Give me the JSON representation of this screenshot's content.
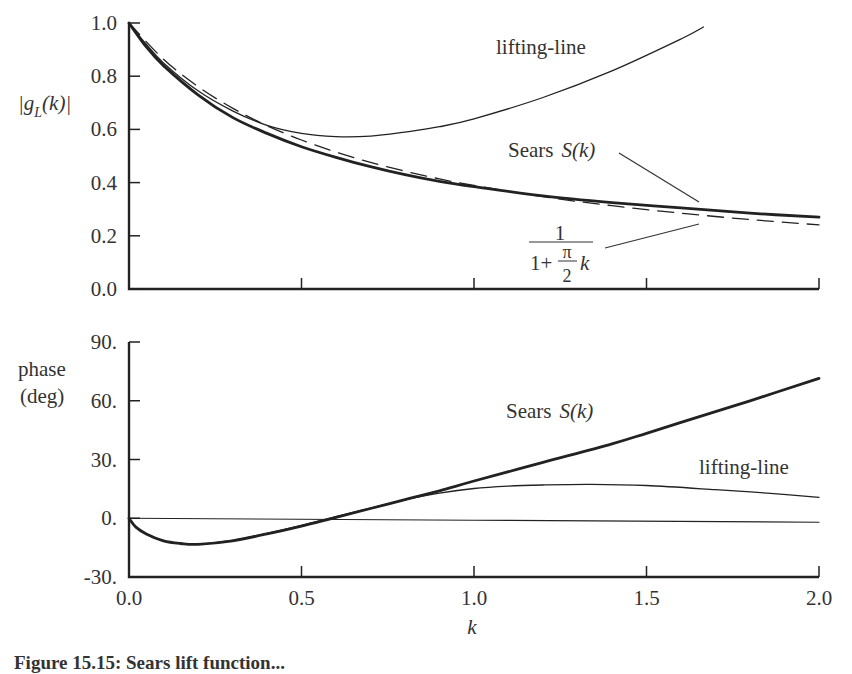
{
  "chart_data": [
    {
      "type": "line",
      "panel": "top",
      "title": "",
      "xlabel": "k",
      "ylabel": "|g_L(k)|",
      "xlim": [
        0.0,
        2.0
      ],
      "ylim": [
        0.0,
        1.0
      ],
      "x_ticks": [
        "0.0",
        "0.5",
        "1.0",
        "1.5",
        "2.0"
      ],
      "y_ticks": [
        "0.0",
        "0.2",
        "0.4",
        "0.6",
        "0.8",
        "1.0"
      ],
      "grid": false,
      "series": [
        {
          "name": "Sears S(k)",
          "style": "thick-solid",
          "x": [
            0,
            0.05,
            0.1,
            0.2,
            0.3,
            0.4,
            0.5,
            0.6,
            0.7,
            0.8,
            0.9,
            1.0,
            1.2,
            1.4,
            1.6,
            1.8,
            2.0
          ],
          "values": [
            1.0,
            0.91,
            0.84,
            0.73,
            0.645,
            0.585,
            0.535,
            0.495,
            0.46,
            0.43,
            0.405,
            0.385,
            0.35,
            0.325,
            0.305,
            0.285,
            0.27
          ]
        },
        {
          "name": "1/(1+(π/2)k)",
          "style": "dashed",
          "x": [
            0,
            0.1,
            0.2,
            0.3,
            0.4,
            0.5,
            0.6,
            0.7,
            0.8,
            0.9,
            1.0,
            1.2,
            1.4,
            1.6,
            1.8,
            2.0
          ],
          "values": [
            1.0,
            0.864,
            0.761,
            0.68,
            0.614,
            0.56,
            0.515,
            0.476,
            0.443,
            0.414,
            0.389,
            0.347,
            0.313,
            0.285,
            0.261,
            0.241
          ]
        },
        {
          "name": "lifting-line",
          "style": "thin-solid",
          "x": [
            0,
            0.05,
            0.1,
            0.2,
            0.3,
            0.4,
            0.5,
            0.6,
            0.7,
            0.8,
            0.9,
            1.0,
            1.2,
            1.4,
            1.6,
            1.665
          ],
          "values": [
            1.0,
            0.92,
            0.85,
            0.745,
            0.67,
            0.615,
            0.585,
            0.573,
            0.575,
            0.59,
            0.61,
            0.64,
            0.72,
            0.82,
            0.94,
            0.985
          ]
        }
      ],
      "annotations": [
        {
          "text": "lifting-line",
          "x": 1.1,
          "y": 0.86
        },
        {
          "text": "Sears",
          "italic_part": "S(k)",
          "x": 1.12,
          "y": 0.48
        },
        {
          "text": "1 / (1+ π/2 k)",
          "numerator": "1",
          "denominator_prefix": "1+",
          "pi": "π",
          "two": "2",
          "k": "k",
          "x": 1.1,
          "y": 0.2
        }
      ]
    },
    {
      "type": "line",
      "panel": "bottom",
      "title": "",
      "xlabel": "k",
      "ylabel": "phase (deg)",
      "xlim": [
        0.0,
        2.0
      ],
      "ylim": [
        -30,
        90
      ],
      "x_ticks": [
        "0.0",
        "0.5",
        "1.0",
        "1.5",
        "2.0"
      ],
      "y_ticks": [
        "-30.",
        "0.",
        "30.",
        "60.",
        "90."
      ],
      "grid": false,
      "series": [
        {
          "name": "Sears S(k)",
          "style": "thick-solid",
          "x": [
            0,
            0.02,
            0.05,
            0.1,
            0.15,
            0.2,
            0.3,
            0.4,
            0.5,
            0.6,
            0.7,
            0.8,
            0.9,
            1.0,
            1.2,
            1.4,
            1.5,
            1.6,
            1.8,
            2.0
          ],
          "values": [
            0,
            -4.5,
            -8,
            -11.5,
            -12.9,
            -13.3,
            -11.5,
            -8,
            -4,
            0.5,
            5,
            9.5,
            14,
            19,
            28.5,
            38,
            43.4,
            49,
            60,
            71.4
          ]
        },
        {
          "name": "lifting-line",
          "style": "thin-solid",
          "x": [
            0,
            0.02,
            0.05,
            0.1,
            0.15,
            0.2,
            0.3,
            0.4,
            0.5,
            0.6,
            0.7,
            0.8,
            0.9,
            1.0,
            1.1,
            1.2,
            1.34,
            1.5,
            1.7,
            1.85,
            2.0
          ],
          "values": [
            0,
            -4.5,
            -8,
            -11.5,
            -12.9,
            -13.3,
            -11.3,
            -7.7,
            -3.6,
            0.8,
            5.2,
            9.4,
            12.8,
            15.2,
            16.4,
            17.0,
            17.3,
            16.7,
            14.6,
            12.8,
            10.7
          ]
        },
        {
          "name": "zero reference",
          "style": "hairline",
          "x": [
            0,
            2.0
          ],
          "values": [
            0,
            -2
          ]
        }
      ],
      "annotations": [
        {
          "text": "Sears",
          "italic_part": "S(k)",
          "x": 1.1,
          "y": 56
        },
        {
          "text": "lifting-line",
          "x": 1.63,
          "y": 26
        }
      ]
    }
  ],
  "labels": {
    "top_ylabel_prefix": "|g",
    "top_ylabel_sub": "L",
    "top_ylabel_suffix": "(k)|",
    "bottom_ylabel_line1": "phase",
    "bottom_ylabel_line2": "(deg)",
    "xlabel": "k",
    "top_lifting_line": "lifting-line",
    "top_sears": "Sears",
    "top_sears_fn": "S(k)",
    "frac_num": "1",
    "frac_den_prefix": "1+",
    "frac_pi": "π",
    "frac_two": "2",
    "frac_k": "k",
    "bottom_sears": "Sears",
    "bottom_sears_fn": "S(k)",
    "bottom_lifting_line": "lifting-line"
  },
  "caption": "Figure 15.15: Sears lift function..."
}
